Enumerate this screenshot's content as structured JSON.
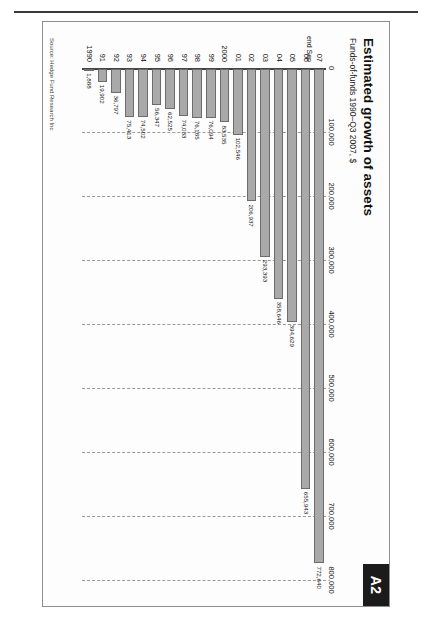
{
  "page": {
    "tab_label": "A2",
    "title": "Estimated growth of assets",
    "subtitle": "Funds-of-funds 1990–Q3 2007, $",
    "source": "Source: Hedge Fund Research Inc"
  },
  "chart_data": {
    "type": "bar",
    "orientation": "horizontal",
    "title": "Estimated growth of assets",
    "subtitle": "Funds-of-funds 1990–Q3 2007, $",
    "xlabel": "",
    "ylabel": "",
    "xlim": [
      0,
      800000
    ],
    "grid": true,
    "legend": null,
    "axis_ticks": [
      "0",
      "100,000",
      "200,000",
      "300,000",
      "400,000",
      "500,000",
      "600,000",
      "700,000",
      "800,000"
    ],
    "axis_tick_values": [
      0,
      100000,
      200000,
      300000,
      400000,
      500000,
      600000,
      700000,
      800000
    ],
    "categories": [
      "1990",
      "91",
      "92",
      "93",
      "94",
      "95",
      "96",
      "97",
      "98",
      "99",
      "2000",
      "01",
      "02",
      "03",
      "04",
      "05",
      "06",
      "07"
    ],
    "category_note": "end Sep",
    "category_note_for": "07",
    "values": [
      1888,
      19902,
      36797,
      75413,
      74502,
      56347,
      62525,
      74033,
      76185,
      76094,
      83535,
      102546,
      206937,
      293393,
      358646,
      394629,
      655943,
      772640
    ],
    "value_labels": [
      "1,888",
      "19,902",
      "36,797",
      "75,413",
      "74,502",
      "56,347",
      "62,525",
      "74,033",
      "76,185",
      "76,094",
      "83,535",
      "102,546",
      "206,937",
      "293,393",
      "358,646",
      "394,629",
      "655,943",
      "772,640"
    ],
    "bar_color": "#a9a9a9",
    "bar_border_color": "#6c6c6c",
    "gridline_color": "#9a9a9a",
    "axis_color": "#444444"
  }
}
